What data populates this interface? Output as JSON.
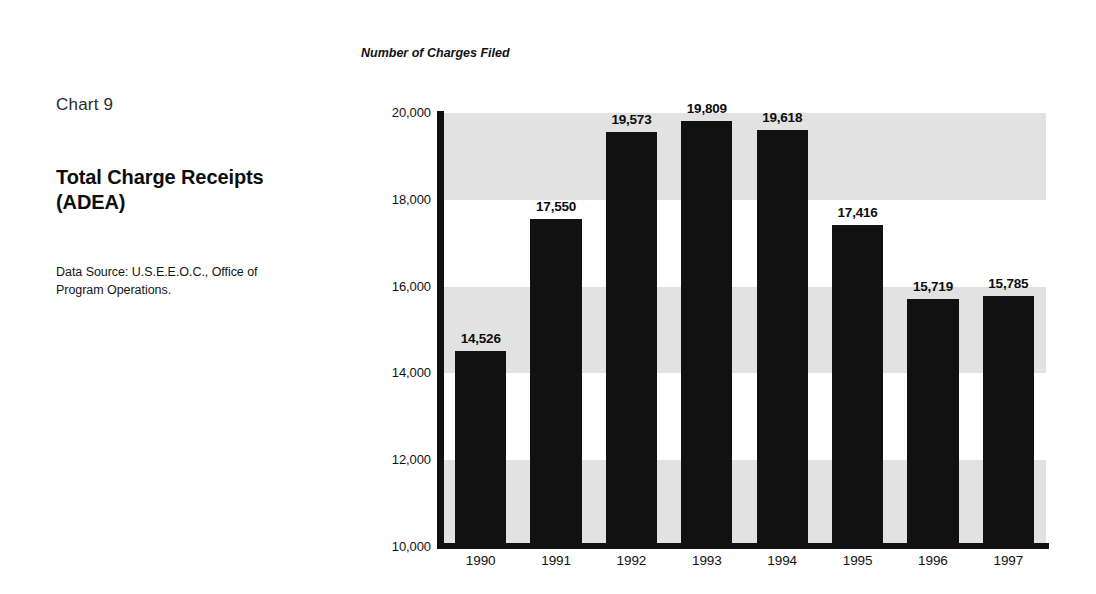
{
  "panel": {
    "chart_number": "Chart 9",
    "title_line1": "Total Charge Receipts",
    "title_line2": "(ADEA)",
    "source_note": "Data Source: U.S.E.E.O.C., Office of Program Operations."
  },
  "chart_data": {
    "type": "bar",
    "title": "Total Charge Receipts (ADEA)",
    "subtitle": "Chart 9",
    "ylabel": "Number of Charges Filed",
    "xlabel": "",
    "categories": [
      "1990",
      "1991",
      "1992",
      "1993",
      "1994",
      "1995",
      "1996",
      "1997"
    ],
    "values": [
      14526,
      17550,
      19573,
      19809,
      19618,
      17416,
      15719,
      15785
    ],
    "value_labels": [
      "14,526",
      "17,550",
      "19,573",
      "19,809",
      "19,618",
      "17,416",
      "15,719",
      "15,785"
    ],
    "ylim": [
      10000,
      20000
    ],
    "ytick_values": [
      10000,
      12000,
      14000,
      16000,
      18000,
      20000
    ],
    "ytick_labels": [
      "10,000",
      "12,000",
      "14,000",
      "16,000",
      "18,000",
      "20,000"
    ],
    "grid": false,
    "banded_background": true,
    "band_ranges": [
      [
        18000,
        20000
      ],
      [
        14000,
        16000
      ],
      [
        10000,
        12000
      ]
    ],
    "legend": null,
    "colors": {
      "bar": "#111111",
      "band": "#e2e2e2",
      "axis": "#111111",
      "background": "#ffffff",
      "text": "#111111"
    }
  }
}
